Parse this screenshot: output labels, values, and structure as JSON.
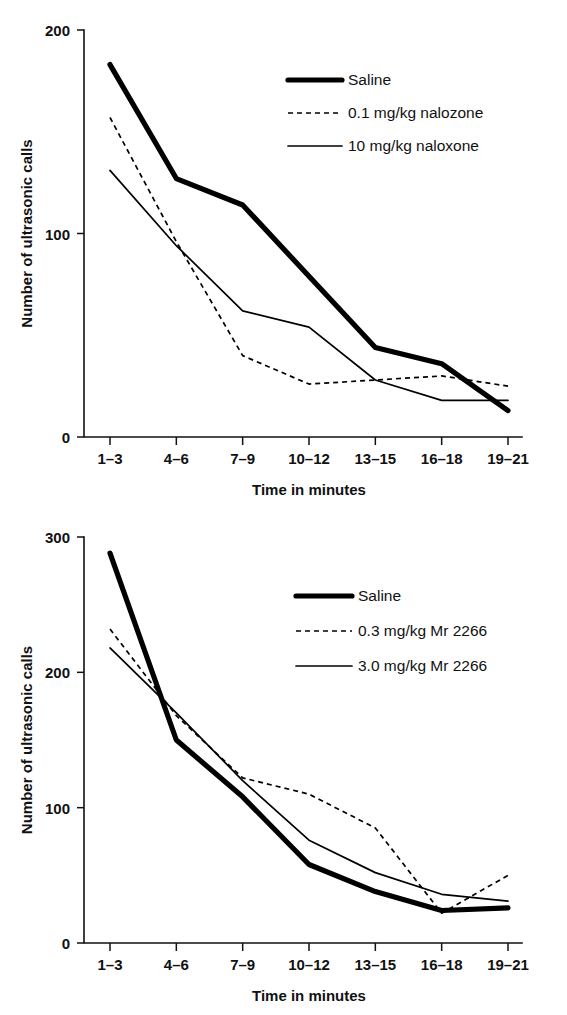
{
  "figure": {
    "panel_count": 2,
    "background_color": "#ffffff",
    "line_color": "#000000"
  },
  "chart_data": [
    {
      "panel": "top",
      "type": "line",
      "title": "",
      "xlabel": "Time in minutes",
      "ylabel": "Number of ultrasonic calls",
      "categories": [
        "1–3",
        "4–6",
        "7–9",
        "10–12",
        "13–15",
        "16–18",
        "19–21"
      ],
      "yticks": [
        0,
        100,
        200
      ],
      "ytick_labels": [
        "0",
        "100",
        "200"
      ],
      "ylim": [
        0,
        200
      ],
      "grid": false,
      "legend_position": "top-right",
      "series": [
        {
          "name": "Saline",
          "style": "thick-solid",
          "values": [
            183,
            127,
            114,
            79,
            44,
            36,
            13
          ]
        },
        {
          "name": "0.1 mg/kg nalozone",
          "style": "dashed",
          "values": [
            157,
            96,
            40,
            26,
            28,
            30,
            25
          ]
        },
        {
          "name": "10 mg/kg naloxone",
          "style": "thin-solid",
          "values": [
            131,
            94,
            62,
            54,
            28,
            18,
            18
          ]
        }
      ]
    },
    {
      "panel": "bottom",
      "type": "line",
      "title": "",
      "xlabel": "Time in minutes",
      "ylabel": "Number of ultrasonic calls",
      "categories": [
        "1–3",
        "4–6",
        "7–9",
        "10–12",
        "13–15",
        "16–18",
        "19–21"
      ],
      "yticks": [
        0,
        100,
        200,
        300
      ],
      "ytick_labels": [
        "0",
        "100",
        "200",
        "300"
      ],
      "ylim": [
        0,
        300
      ],
      "grid": false,
      "legend_position": "top-right",
      "series": [
        {
          "name": "Saline",
          "style": "thick-solid",
          "values": [
            288,
            150,
            108,
            58,
            38,
            24,
            26
          ]
        },
        {
          "name": "0.3 mg/kg Mr 2266",
          "style": "dashed",
          "values": [
            232,
            168,
            122,
            110,
            85,
            22,
            50
          ]
        },
        {
          "name": "3.0 mg/kg Mr 2266",
          "style": "thin-solid",
          "values": [
            218,
            170,
            120,
            76,
            52,
            36,
            31
          ]
        }
      ]
    }
  ]
}
